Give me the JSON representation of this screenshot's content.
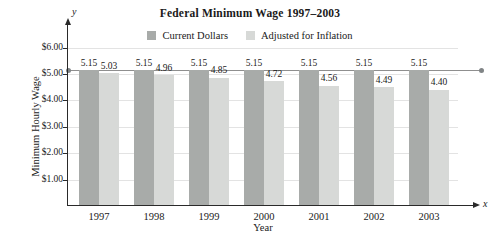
{
  "figure": {
    "y_arrow_label": "y",
    "x_arrow_label": "x"
  },
  "chart_data": {
    "type": "bar",
    "title": "Federal Minimum Wage 1997–2003",
    "xlabel": "Year",
    "ylabel": "Minimum Hourly Wage",
    "categories": [
      "1997",
      "1998",
      "1999",
      "2000",
      "2001",
      "2002",
      "2003"
    ],
    "series": [
      {
        "name": "Current Dollars",
        "color": "#a8aba9",
        "values": [
          5.15,
          5.15,
          5.15,
          5.15,
          5.15,
          5.15,
          5.15
        ]
      },
      {
        "name": "Adjusted for Inflation",
        "color": "#d7d9d7",
        "values": [
          5.03,
          4.96,
          4.85,
          4.72,
          4.56,
          4.49,
          4.4
        ]
      }
    ],
    "ylim": [
      0,
      6.3
    ],
    "yticks": [
      {
        "value": 1,
        "label": "$1.00"
      },
      {
        "value": 2,
        "label": "$2.00"
      },
      {
        "value": 3,
        "label": "$3.00"
      },
      {
        "value": 4,
        "label": "$4.00"
      },
      {
        "value": 5,
        "label": "$5.00"
      },
      {
        "value": 6,
        "label": "$6.00"
      }
    ],
    "grid": true,
    "legend_position": "top-center",
    "value_labels_shown": true,
    "reference_line": {
      "value": 5.15,
      "color": "#8f8f8f",
      "end_markers": "dots"
    }
  }
}
